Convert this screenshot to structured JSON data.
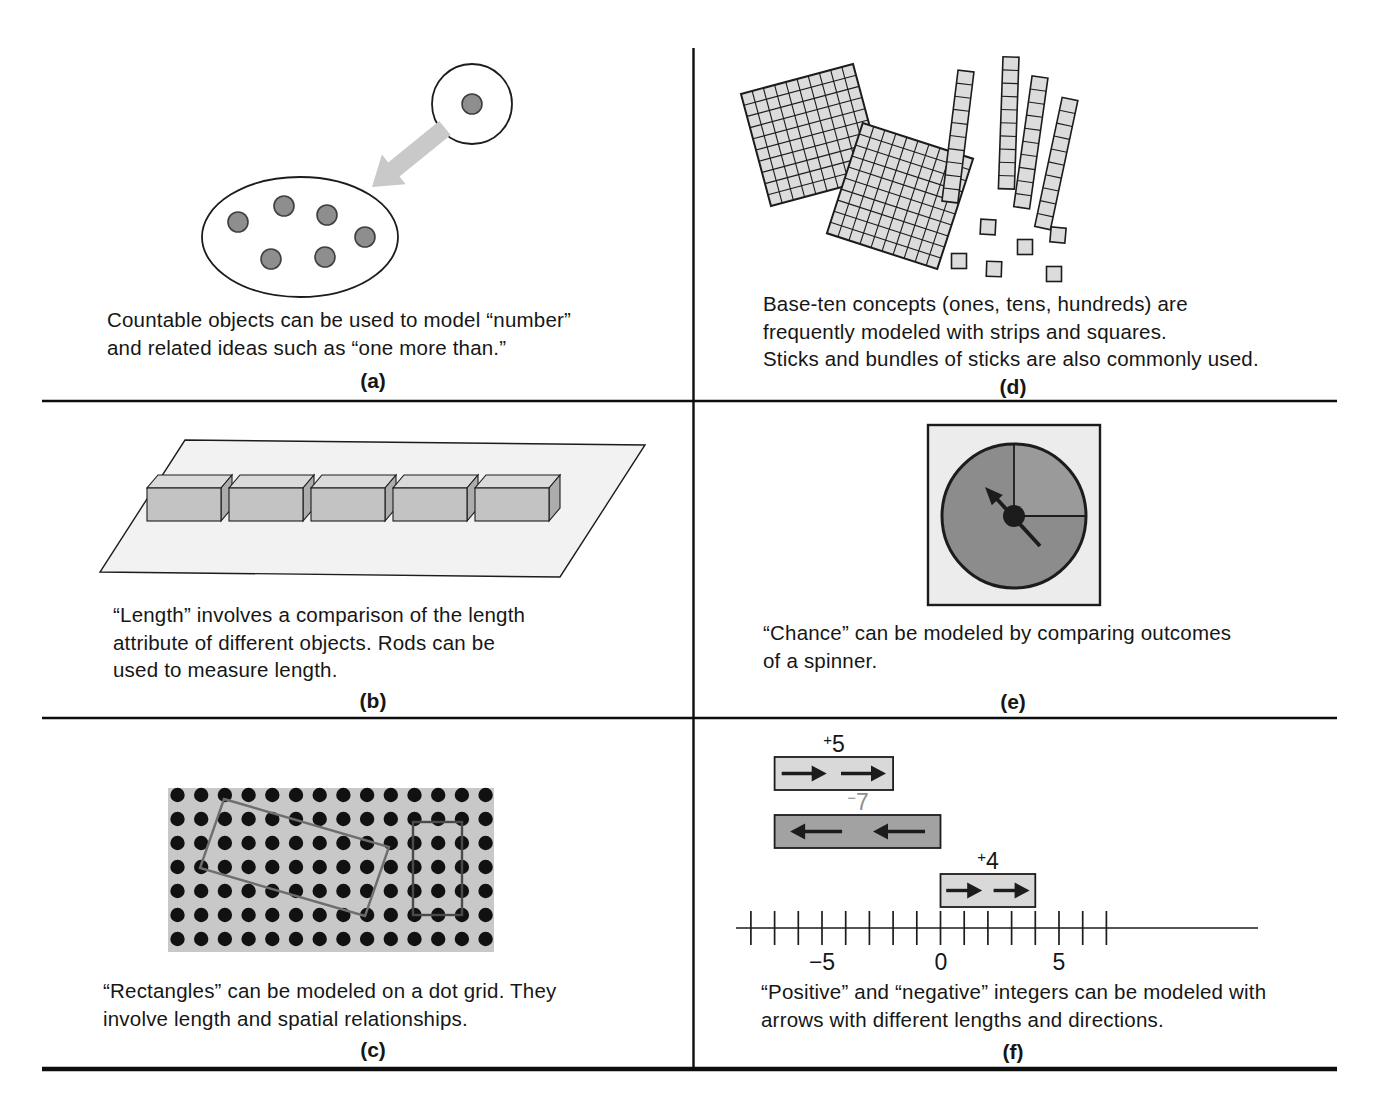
{
  "panels": {
    "a": {
      "label": "(a)",
      "caption_lines": [
        "Countable objects can be used to model “number”",
        "and related ideas such as “one more than.”"
      ]
    },
    "b": {
      "label": "(b)",
      "caption_lines": [
        "“Length” involves a comparison of the length",
        "attribute of different objects. Rods can be",
        "used to measure length."
      ]
    },
    "c": {
      "label": "(c)",
      "caption_lines": [
        "“Rectangles” can be modeled on a dot grid. They",
        "involve length and spatial relationships."
      ]
    },
    "d": {
      "label": "(d)",
      "caption_lines": [
        "Base-ten concepts (ones, tens, hundreds) are",
        "frequently modeled with strips and squares.",
        "Sticks and bundles of sticks are also commonly used."
      ]
    },
    "e": {
      "label": "(e)",
      "caption_lines": [
        "“Chance” can be modeled by comparing outcomes",
        "of a spinner."
      ]
    },
    "f": {
      "label": "(f)",
      "caption_lines": [
        "“Positive” and “negative” integers can be modeled with",
        "arrows with different lengths and directions."
      ]
    }
  },
  "integer_diagram": {
    "bars": [
      {
        "sign": "+",
        "magnitude": "5",
        "value": 5,
        "from": -7,
        "to": -2,
        "direction": "right"
      },
      {
        "sign": "−",
        "magnitude": "7",
        "value": -7,
        "from": -7,
        "to": 0,
        "direction": "left"
      },
      {
        "sign": "+",
        "magnitude": "4",
        "value": 4,
        "from": 0,
        "to": 4,
        "direction": "right"
      }
    ],
    "number_line": {
      "tick_start": -8,
      "tick_end": 7,
      "tick_labels": [
        {
          "value": -5,
          "text": "−5"
        },
        {
          "value": 0,
          "text": "0"
        },
        {
          "value": 5,
          "text": "5"
        }
      ]
    }
  },
  "counts": {
    "single_counter_dots": 1,
    "group_counter_dots": 6,
    "rods": 5,
    "hundreds_squares": 2,
    "hundreds_grid_size": 10,
    "ten_strips": 4,
    "ten_strip_cells": 10,
    "ones_squares": 6,
    "dot_grid_columns": 14,
    "dot_grid_rows": 7
  },
  "colors": {
    "text": "#161616",
    "rule": "#0d0d0d",
    "ink": "#1c1c1c",
    "counter_fill": "#8e8e8e",
    "soft_arrow": "#c9c9c9",
    "plane_fill": "#f2f2f2",
    "rod_top": "#dadada",
    "rod_front": "#c3c3c3",
    "rod_side": "#acacac",
    "base_ten_fill": "#dcdcdc",
    "dot_grid_bg": "#c8c8c8",
    "dot_grid_dot": "#111111",
    "rect_outline_tilted": "#6e6e6e",
    "rect_outline_upright": "#4a4a4a",
    "spinner_card": "#ececec",
    "spinner_fill": "#8c8c8c",
    "spinner_quarter": "#9a9a9a",
    "bar_positive": "#d9d9d9",
    "bar_negative": "#a2a2a2",
    "bar_negative_label": "#8f8f8f"
  }
}
